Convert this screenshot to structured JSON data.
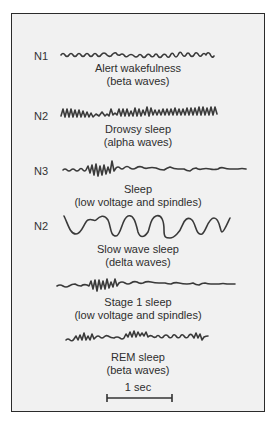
{
  "diagram": {
    "rows": [
      {
        "stage_label": "N1",
        "caption_line1": "Alert wakefulness",
        "caption_line2": "(beta waves)",
        "wave_type": "beta-low-amplitude"
      },
      {
        "stage_label": "N2",
        "caption_line1": "Drowsy sleep",
        "caption_line2": "(alpha waves)",
        "wave_type": "alpha"
      },
      {
        "stage_label": "N3",
        "caption_line1": "Sleep",
        "caption_line2": "(low voltage and spindles)",
        "wave_type": "spindle"
      },
      {
        "stage_label": "N2",
        "caption_line1": "Slow wave sleep",
        "caption_line2": "(delta waves)",
        "wave_type": "delta"
      },
      {
        "stage_label": "",
        "caption_line1": "Stage 1 sleep",
        "caption_line2": "(low voltage and spindles)",
        "wave_type": "spindle"
      },
      {
        "stage_label": "",
        "caption_line1": "REM sleep",
        "caption_line2": "(beta waves)",
        "wave_type": "beta-mixed"
      }
    ],
    "scale_bar": {
      "label": "1 sec"
    },
    "colors": {
      "panel_background": "#f1f1f1",
      "border": "#2b2b2b",
      "trace": "#3a3a3a"
    }
  }
}
